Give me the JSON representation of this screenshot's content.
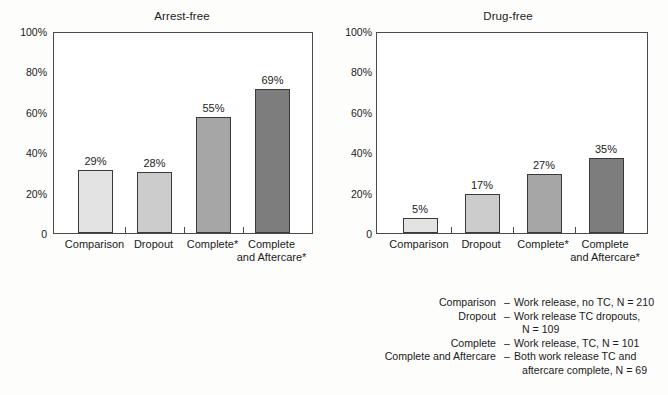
{
  "chart_data": [
    {
      "type": "bar",
      "title": "Arrest-free",
      "xlabel": "",
      "ylabel": "",
      "ylim": [
        0,
        100
      ],
      "yticks": [
        "0",
        "20%",
        "40%",
        "60%",
        "80%",
        "100%"
      ],
      "ytick_values": [
        0,
        20,
        40,
        60,
        80,
        100
      ],
      "grid": false,
      "legend": "none",
      "categories": [
        "Comparison",
        "Dropout",
        "Complete*",
        "Complete\nand Aftercare*"
      ],
      "values": [
        29,
        28,
        55,
        69
      ],
      "value_labels": [
        "29%",
        "28%",
        "55%",
        "69%"
      ],
      "bar_colors": [
        "#e3e3e3",
        "#cccccc",
        "#a6a6a6",
        "#7d7d7d"
      ]
    },
    {
      "type": "bar",
      "title": "Drug-free",
      "xlabel": "",
      "ylabel": "",
      "ylim": [
        0,
        100
      ],
      "yticks": [
        "0",
        "20%",
        "40%",
        "60%",
        "80%",
        "100%"
      ],
      "ytick_values": [
        0,
        20,
        40,
        60,
        80,
        100
      ],
      "grid": false,
      "legend": "none",
      "categories": [
        "Comparison",
        "Dropout",
        "Complete*",
        "Complete\nand Aftercare*"
      ],
      "values": [
        5,
        17,
        27,
        35
      ],
      "value_labels": [
        "5%",
        "17%",
        "27%",
        "35%"
      ],
      "bar_colors": [
        "#e3e3e3",
        "#cccccc",
        "#a6a6a6",
        "#7d7d7d"
      ]
    }
  ],
  "legend": {
    "rows": [
      {
        "term": "Comparison",
        "dash": "–",
        "desc": "Work release, no TC, N = 210",
        "cont": ""
      },
      {
        "term": "Dropout",
        "dash": "–",
        "desc": "Work release TC dropouts,",
        "cont": "N = 109"
      },
      {
        "term": "Complete",
        "dash": "–",
        "desc": "Work release, TC, N = 101",
        "cont": ""
      },
      {
        "term": "Complete and Aftercare",
        "dash": "–",
        "desc": "Both work release TC and",
        "cont": "aftercare complete, N = 69"
      }
    ]
  }
}
